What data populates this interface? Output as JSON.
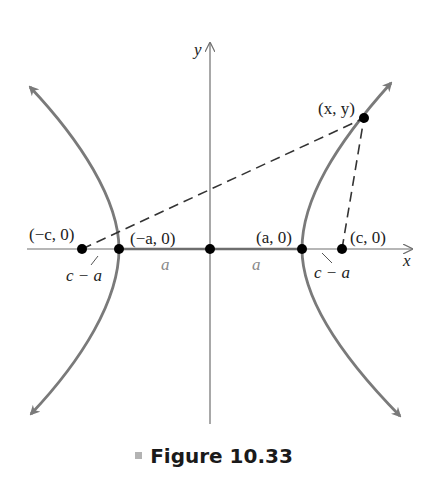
{
  "figure": {
    "caption": "Figure 10.33",
    "colors": {
      "curve": "#7a7a7a",
      "axis": "#6e6e6e",
      "segment_a": "#6e6e6e",
      "dashed": "#333333",
      "point": "#000000",
      "dim_label": "#8a8a8a",
      "caption_marker": "#b3b3b3"
    },
    "axes": {
      "x_label": "x",
      "y_label": "y"
    },
    "points": {
      "neg_c": "(−c, 0)",
      "neg_a": "(−a, 0)",
      "pos_a": "(a, 0)",
      "pos_c": "(c, 0)",
      "xy": "(x, y)"
    },
    "distances": {
      "left_gap": "c − a",
      "right_gap": "c − a",
      "left_a": "a",
      "right_a": "a"
    }
  }
}
